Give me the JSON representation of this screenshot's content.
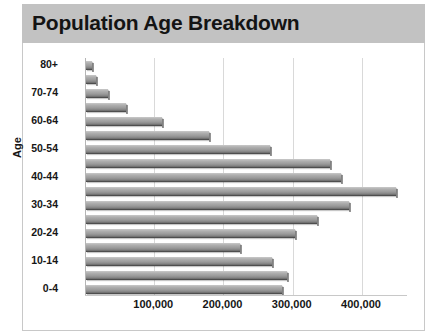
{
  "title": "Population Age Breakdown",
  "theme": {
    "banner_bg": "#c2c2c2",
    "panel_bg": "#ffffff",
    "border": "#c8c8c8",
    "gridline": "#d9d9d9",
    "bar_light": "#c9c9c9",
    "bar_dark": "#3b3b3b",
    "text": "#161616"
  },
  "chart_data": {
    "type": "bar",
    "orientation": "horizontal",
    "title": "Population Age Breakdown",
    "xlabel": "",
    "ylabel": "Age",
    "categories": [
      "0-4",
      "5-9",
      "10-14",
      "15-19",
      "20-24",
      "25-29",
      "30-34",
      "35-39",
      "40-44",
      "45-49",
      "50-54",
      "55-59",
      "60-64",
      "65-69",
      "70-74",
      "75-79",
      "80+"
    ],
    "values": [
      283000,
      290000,
      268000,
      222000,
      302000,
      333000,
      380000,
      448000,
      368000,
      353000,
      265000,
      177000,
      110000,
      58000,
      32000,
      15000,
      9000
    ],
    "xlim": [
      0,
      465000
    ],
    "ylim_categories": 17,
    "xticks": [
      100000,
      200000,
      300000,
      400000
    ],
    "xtick_labels": [
      "100,000",
      "200,000",
      "300,000",
      "400,000"
    ],
    "ytick_labels": [
      "0-4",
      "10-14",
      "20-24",
      "30-34",
      "40-44",
      "50-54",
      "60-64",
      "70-74",
      "80+"
    ],
    "grid": true,
    "grid_axis": "x",
    "legend": false,
    "legend_position": "none"
  }
}
